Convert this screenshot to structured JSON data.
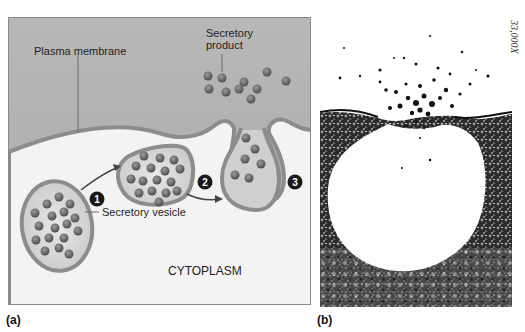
{
  "panel_a": {
    "caption": "(a)",
    "labels": {
      "plasma_membrane": "Plasma membrane",
      "secretory_product": "Secretory product",
      "secretory_product_line1": "Secretory",
      "secretory_product_line2": "product",
      "secretory_vesicle": "Secretory vesicle",
      "cytoplasm": "CYTOPLASM"
    },
    "steps": [
      "1",
      "2",
      "3"
    ],
    "colors": {
      "extracellular": "#b4b4b4",
      "cytoplasm": "#f4f4f4",
      "membrane": "#8c8c8c",
      "granule": "#6a6a6a",
      "step_badge": "#1a1a1a"
    }
  },
  "panel_b": {
    "caption": "(b)",
    "magnification": "33,000X",
    "description": "Electron micrograph of exocytosis"
  }
}
